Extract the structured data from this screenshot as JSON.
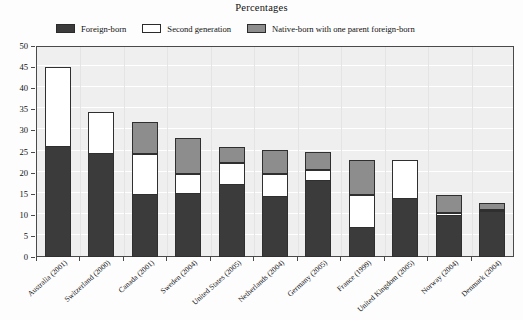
{
  "chart_data": {
    "type": "bar",
    "subtype": "stacked-vertical",
    "title": "Percentages",
    "xlabel": "",
    "ylabel": "",
    "ylim": [
      0,
      50
    ],
    "ytick_step": 5,
    "yticks": [
      0,
      5,
      10,
      15,
      20,
      25,
      30,
      35,
      40,
      45,
      50
    ],
    "grid": true,
    "legend_position": "top",
    "categories": [
      "Australia (2001)",
      "Switzerland (2000)",
      "Canada (2001)",
      "Sweden (2004)",
      "United States (2005)",
      "Netherlands (2004)",
      "Germany (2005)",
      "France (1999)",
      "United Kingdom (2005)",
      "Norway (2004)",
      "Denmark (2004)"
    ],
    "series": [
      {
        "name": "Foreign-born",
        "color": "#3b3b3b",
        "values": [
          26.0,
          24.3,
          14.6,
          15.0,
          17.0,
          14.2,
          18.0,
          6.8,
          13.8,
          9.8,
          10.6
        ]
      },
      {
        "name": "Second generation",
        "color": "#ffffff",
        "values": [
          19.0,
          10.0,
          9.7,
          4.7,
          5.3,
          5.5,
          2.7,
          8.0,
          9.1,
          0.7,
          0.6
        ]
      },
      {
        "name": "Native-born with one parent foreign-born",
        "color": "#8d8d8d",
        "values": [
          0.0,
          0.0,
          7.7,
          8.4,
          3.7,
          5.7,
          4.1,
          8.1,
          0.0,
          4.2,
          1.5
        ]
      }
    ],
    "totals": [
      45.0,
      34.3,
      32.0,
      28.1,
      26.0,
      25.4,
      24.8,
      22.9,
      22.9,
      14.7,
      12.7
    ]
  },
  "legend": {
    "items": [
      {
        "label": "Foreign-born",
        "swatch": "legend-swatch-dark"
      },
      {
        "label": "Second generation",
        "swatch": "legend-swatch-white"
      },
      {
        "label": "Native-born with one parent foreign-born",
        "swatch": "legend-swatch-gray"
      }
    ]
  },
  "colors": {
    "foreign_born": "#3b3b3b",
    "second_generation": "#ffffff",
    "native_born_one_parent": "#8d8d8d",
    "plot_background": "#efefef",
    "axis": "#4a4a4a"
  }
}
